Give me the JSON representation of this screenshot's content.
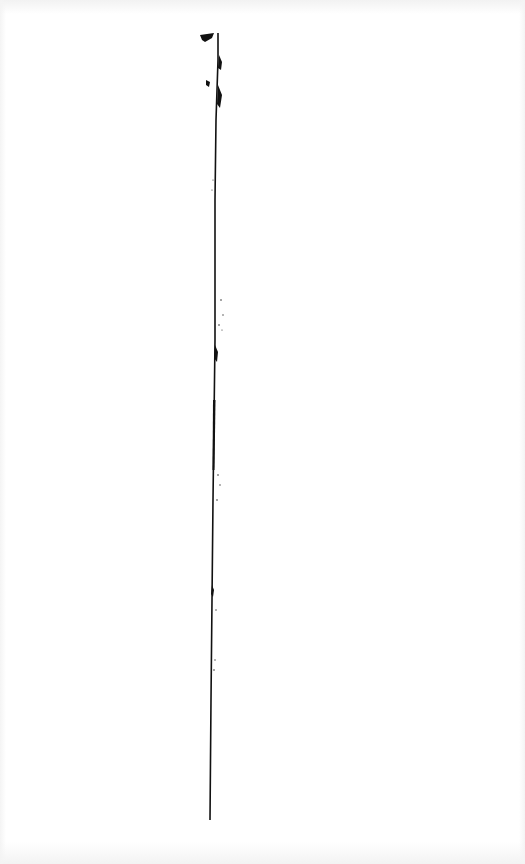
{
  "document": {
    "type": "scanned-page",
    "background": "#ffffff",
    "ink_color": "#111111",
    "content": "single vertical hand-drawn line with ink blots; no legible text"
  }
}
